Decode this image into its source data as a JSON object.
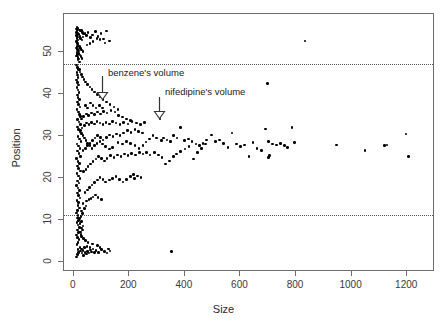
{
  "chart_data": {
    "type": "scatter",
    "title": "",
    "xlabel": "Size",
    "ylabel": "Position",
    "xlim": [
      -35,
      1300
    ],
    "ylim": [
      -2.5,
      59
    ],
    "grid": false,
    "legend": "none",
    "xticks": [
      0,
      200,
      400,
      600,
      800,
      1000,
      1200
    ],
    "yticks": [
      0,
      10,
      20,
      30,
      40,
      50
    ],
    "reference_lines": [
      {
        "name": "upper-dotted-line",
        "axis": "y",
        "value": 47
      },
      {
        "name": "lower-dotted-line",
        "axis": "y",
        "value": 11
      }
    ],
    "annotations": [
      {
        "text": "benzene's volume",
        "x": 105,
        "y": 44.5,
        "arrow_x": 105,
        "arrow_y_from": 44.0,
        "arrow_y_to": 38.5
      },
      {
        "text": "nifedipine's volume",
        "x": 310,
        "y": 40.0,
        "arrow_x": 310,
        "arrow_y_from": 39.0,
        "arrow_y_to": 34.0
      }
    ],
    "points": [
      [
        10,
        55.4
      ],
      [
        12,
        55.1
      ],
      [
        11,
        54.6
      ],
      [
        13,
        54.2
      ],
      [
        10,
        53.9
      ],
      [
        14,
        53.5
      ],
      [
        12,
        53.1
      ],
      [
        15,
        52.8
      ],
      [
        11,
        52.4
      ],
      [
        13,
        52.0
      ],
      [
        16,
        51.6
      ],
      [
        12,
        51.2
      ],
      [
        10,
        50.9
      ],
      [
        14,
        50.5
      ],
      [
        17,
        50.2
      ],
      [
        12,
        49.8
      ],
      [
        13,
        49.4
      ],
      [
        11,
        49.0
      ],
      [
        15,
        48.7
      ],
      [
        18,
        48.3
      ],
      [
        12,
        55.8
      ],
      [
        16,
        55.5
      ],
      [
        20,
        55.2
      ],
      [
        24,
        54.9
      ],
      [
        14,
        54.5
      ],
      [
        19,
        54.1
      ],
      [
        22,
        53.7
      ],
      [
        27,
        55.0
      ],
      [
        31,
        54.6
      ],
      [
        36,
        54.2
      ],
      [
        25,
        53.2
      ],
      [
        30,
        52.8
      ],
      [
        34,
        53.5
      ],
      [
        40,
        54.3
      ],
      [
        45,
        53.9
      ],
      [
        52,
        54.6
      ],
      [
        60,
        53.4
      ],
      [
        68,
        54.0
      ],
      [
        78,
        54.8
      ],
      [
        88,
        53.6
      ],
      [
        98,
        54.4
      ],
      [
        108,
        53.0
      ],
      [
        118,
        54.9
      ],
      [
        128,
        52.6
      ],
      [
        112,
        52.1
      ],
      [
        95,
        52.9
      ],
      [
        84,
        53.2
      ],
      [
        70,
        52.4
      ],
      [
        58,
        52.0
      ],
      [
        48,
        51.6
      ],
      [
        20,
        51.2
      ],
      [
        24,
        50.8
      ],
      [
        28,
        50.4
      ],
      [
        33,
        50.0
      ],
      [
        18,
        49.6
      ],
      [
        22,
        49.2
      ],
      [
        26,
        48.8
      ],
      [
        30,
        48.4
      ],
      [
        16,
        48.0
      ],
      [
        20,
        47.6
      ],
      [
        11,
        46.8
      ],
      [
        13,
        46.2
      ],
      [
        15,
        45.7
      ],
      [
        12,
        45.1
      ],
      [
        14,
        44.5
      ],
      [
        16,
        43.9
      ],
      [
        11,
        43.3
      ],
      [
        13,
        42.7
      ],
      [
        17,
        42.1
      ],
      [
        12,
        41.5
      ],
      [
        15,
        40.9
      ],
      [
        19,
        40.3
      ],
      [
        13,
        39.7
      ],
      [
        16,
        39.1
      ],
      [
        21,
        38.6
      ],
      [
        14,
        38.0
      ],
      [
        18,
        37.4
      ],
      [
        23,
        36.8
      ],
      [
        12,
        36.2
      ],
      [
        17,
        35.6
      ],
      [
        20,
        35.0
      ],
      [
        25,
        34.5
      ],
      [
        14,
        33.9
      ],
      [
        19,
        33.3
      ],
      [
        24,
        32.7
      ],
      [
        13,
        32.1
      ],
      [
        18,
        31.5
      ],
      [
        22,
        31.0
      ],
      [
        28,
        30.4
      ],
      [
        15,
        29.8
      ],
      [
        20,
        29.2
      ],
      [
        26,
        28.6
      ],
      [
        12,
        28.0
      ],
      [
        17,
        27.5
      ],
      [
        23,
        26.9
      ],
      [
        14,
        26.3
      ],
      [
        19,
        25.7
      ],
      [
        25,
        25.1
      ],
      [
        11,
        24.5
      ],
      [
        16,
        23.9
      ],
      [
        21,
        23.3
      ],
      [
        13,
        22.8
      ],
      [
        18,
        22.2
      ],
      [
        24,
        21.6
      ],
      [
        12,
        21.0
      ],
      [
        17,
        20.4
      ],
      [
        22,
        19.8
      ],
      [
        14,
        19.2
      ],
      [
        19,
        18.7
      ],
      [
        11,
        18.1
      ],
      [
        16,
        17.5
      ],
      [
        21,
        16.9
      ],
      [
        13,
        16.3
      ],
      [
        18,
        15.7
      ],
      [
        23,
        15.1
      ],
      [
        12,
        14.6
      ],
      [
        17,
        14.0
      ],
      [
        15,
        13.4
      ],
      [
        20,
        12.8
      ],
      [
        14,
        12.2
      ],
      [
        11,
        11.6
      ],
      [
        16,
        11.0
      ],
      [
        13,
        10.4
      ],
      [
        18,
        9.8
      ],
      [
        12,
        9.3
      ],
      [
        15,
        8.7
      ],
      [
        20,
        8.1
      ],
      [
        14,
        7.5
      ],
      [
        17,
        6.9
      ],
      [
        11,
        6.3
      ],
      [
        13,
        5.7
      ],
      [
        19,
        5.2
      ],
      [
        16,
        4.6
      ],
      [
        12,
        4.0
      ],
      [
        22,
        3.4
      ],
      [
        15,
        2.8
      ],
      [
        18,
        2.2
      ],
      [
        14,
        1.7
      ],
      [
        11,
        1.1
      ],
      [
        25,
        2.5
      ],
      [
        30,
        2.0
      ],
      [
        35,
        1.5
      ],
      [
        28,
        3.0
      ],
      [
        33,
        2.6
      ],
      [
        40,
        2.2
      ],
      [
        45,
        1.8
      ],
      [
        38,
        3.3
      ],
      [
        50,
        2.4
      ],
      [
        55,
        2.0
      ],
      [
        60,
        2.7
      ],
      [
        65,
        2.3
      ],
      [
        70,
        3.0
      ],
      [
        48,
        3.6
      ],
      [
        58,
        3.4
      ],
      [
        75,
        2.1
      ],
      [
        80,
        2.6
      ],
      [
        90,
        2.2
      ],
      [
        100,
        2.8
      ],
      [
        110,
        2.4
      ],
      [
        120,
        2.0
      ],
      [
        130,
        2.5
      ],
      [
        125,
        3.0
      ],
      [
        95,
        3.4
      ],
      [
        85,
        3.8
      ],
      [
        68,
        4.2
      ],
      [
        52,
        4.6
      ],
      [
        42,
        5.0
      ],
      [
        36,
        5.5
      ],
      [
        29,
        6.0
      ],
      [
        26,
        6.5
      ],
      [
        24,
        7.0
      ],
      [
        31,
        7.5
      ],
      [
        27,
        8.0
      ],
      [
        34,
        8.5
      ],
      [
        23,
        9.0
      ],
      [
        29,
        9.5
      ],
      [
        21,
        10.2
      ],
      [
        26,
        10.8
      ],
      [
        32,
        11.4
      ],
      [
        28,
        12.0
      ],
      [
        38,
        12.6
      ],
      [
        44,
        13.2
      ],
      [
        33,
        13.8
      ],
      [
        47,
        14.4
      ],
      [
        55,
        14.8
      ],
      [
        62,
        15.0
      ],
      [
        70,
        15.4
      ],
      [
        78,
        15.9
      ],
      [
        88,
        15.2
      ],
      [
        100,
        14.8
      ],
      [
        41,
        16.5
      ],
      [
        49,
        17.0
      ],
      [
        57,
        17.6
      ],
      [
        66,
        18.2
      ],
      [
        75,
        18.8
      ],
      [
        85,
        19.4
      ],
      [
        95,
        20.0
      ],
      [
        105,
        19.6
      ],
      [
        115,
        19.0
      ],
      [
        128,
        19.4
      ],
      [
        140,
        19.8
      ],
      [
        152,
        20.2
      ],
      [
        165,
        19.5
      ],
      [
        178,
        19.0
      ],
      [
        190,
        19.6
      ],
      [
        205,
        20.2
      ],
      [
        218,
        19.8
      ],
      [
        230,
        20.4
      ],
      [
        242,
        20.0
      ],
      [
        215,
        20.8
      ],
      [
        36,
        21.4
      ],
      [
        44,
        22.0
      ],
      [
        52,
        22.6
      ],
      [
        61,
        23.2
      ],
      [
        70,
        23.8
      ],
      [
        80,
        24.4
      ],
      [
        90,
        25.0
      ],
      [
        100,
        24.6
      ],
      [
        110,
        24.0
      ],
      [
        120,
        24.6
      ],
      [
        132,
        25.2
      ],
      [
        145,
        24.8
      ],
      [
        158,
        25.4
      ],
      [
        170,
        25.0
      ],
      [
        183,
        25.6
      ],
      [
        196,
        25.2
      ],
      [
        208,
        25.8
      ],
      [
        222,
        25.4
      ],
      [
        236,
        26.0
      ],
      [
        250,
        25.6
      ],
      [
        33,
        26.4
      ],
      [
        42,
        27.0
      ],
      [
        50,
        27.6
      ],
      [
        58,
        28.2
      ],
      [
        67,
        28.8
      ],
      [
        76,
        29.4
      ],
      [
        86,
        30.0
      ],
      [
        96,
        29.6
      ],
      [
        106,
        29.0
      ],
      [
        117,
        29.6
      ],
      [
        129,
        30.2
      ],
      [
        141,
        29.8
      ],
      [
        154,
        30.4
      ],
      [
        167,
        30.0
      ],
      [
        180,
        30.6
      ],
      [
        193,
        31.2
      ],
      [
        206,
        30.8
      ],
      [
        220,
        31.4
      ],
      [
        234,
        31.0
      ],
      [
        248,
        30.6
      ],
      [
        30,
        31.8
      ],
      [
        38,
        32.4
      ],
      [
        46,
        33.0
      ],
      [
        55,
        32.6
      ],
      [
        64,
        33.2
      ],
      [
        74,
        32.8
      ],
      [
        84,
        33.4
      ],
      [
        94,
        33.0
      ],
      [
        105,
        32.6
      ],
      [
        116,
        33.2
      ],
      [
        128,
        32.8
      ],
      [
        140,
        33.4
      ],
      [
        152,
        33.0
      ],
      [
        166,
        32.6
      ],
      [
        180,
        33.2
      ],
      [
        195,
        32.8
      ],
      [
        210,
        33.4
      ],
      [
        225,
        33.0
      ],
      [
        240,
        32.6
      ],
      [
        255,
        33.2
      ],
      [
        28,
        34.0
      ],
      [
        36,
        34.6
      ],
      [
        45,
        35.2
      ],
      [
        54,
        34.8
      ],
      [
        64,
        35.4
      ],
      [
        74,
        35.0
      ],
      [
        85,
        35.6
      ],
      [
        96,
        35.2
      ],
      [
        108,
        35.8
      ],
      [
        120,
        35.4
      ],
      [
        134,
        36.0
      ],
      [
        148,
        35.6
      ],
      [
        162,
        34.8
      ],
      [
        176,
        34.4
      ],
      [
        190,
        34.0
      ],
      [
        205,
        33.6
      ],
      [
        160,
        36.2
      ],
      [
        145,
        36.8
      ],
      [
        130,
        37.4
      ],
      [
        118,
        38.0
      ],
      [
        106,
        38.6
      ],
      [
        95,
        39.2
      ],
      [
        85,
        39.8
      ],
      [
        75,
        40.4
      ],
      [
        66,
        41.0
      ],
      [
        58,
        41.6
      ],
      [
        50,
        42.2
      ],
      [
        43,
        42.8
      ],
      [
        37,
        43.4
      ],
      [
        32,
        44.0
      ],
      [
        27,
        44.6
      ],
      [
        23,
        45.2
      ],
      [
        20,
        45.8
      ],
      [
        42,
        37.2
      ],
      [
        50,
        36.6
      ],
      [
        60,
        37.8
      ],
      [
        70,
        37.2
      ],
      [
        80,
        36.6
      ],
      [
        92,
        37.2
      ],
      [
        104,
        36.6
      ],
      [
        260,
        28.5
      ],
      [
        272,
        29.2
      ],
      [
        285,
        30.0
      ],
      [
        298,
        29.4
      ],
      [
        310,
        34.0
      ],
      [
        315,
        28.8
      ],
      [
        322,
        29.4
      ],
      [
        335,
        29.0
      ],
      [
        348,
        28.6
      ],
      [
        352,
        2.4
      ],
      [
        360,
        30.0
      ],
      [
        372,
        29.4
      ],
      [
        385,
        32.0
      ],
      [
        398,
        28.8
      ],
      [
        412,
        29.2
      ],
      [
        425,
        28.6
      ],
      [
        440,
        28.0
      ],
      [
        452,
        27.6
      ],
      [
        465,
        28.2
      ],
      [
        478,
        29.0
      ],
      [
        262,
        26.0
      ],
      [
        275,
        25.4
      ],
      [
        290,
        26.0
      ],
      [
        305,
        25.4
      ],
      [
        318,
        24.8
      ],
      [
        330,
        23.2
      ],
      [
        345,
        24.0
      ],
      [
        358,
        25.0
      ],
      [
        370,
        25.6
      ],
      [
        385,
        26.2
      ],
      [
        400,
        26.8
      ],
      [
        415,
        27.4
      ],
      [
        430,
        24.4
      ],
      [
        445,
        26.0
      ],
      [
        460,
        27.0
      ],
      [
        475,
        28.0
      ],
      [
        495,
        30.2
      ],
      [
        510,
        28.6
      ],
      [
        525,
        29.0
      ],
      [
        540,
        28.2
      ],
      [
        555,
        27.2
      ],
      [
        570,
        30.6
      ],
      [
        585,
        28.0
      ],
      [
        600,
        27.4
      ],
      [
        615,
        27.8
      ],
      [
        630,
        25.0
      ],
      [
        645,
        28.4
      ],
      [
        660,
        27.0
      ],
      [
        675,
        26.4
      ],
      [
        690,
        31.6
      ],
      [
        700,
        28.6
      ],
      [
        705,
        25.2
      ],
      [
        715,
        28.0
      ],
      [
        730,
        27.8
      ],
      [
        745,
        28.2
      ],
      [
        758,
        27.6
      ],
      [
        770,
        27.2
      ],
      [
        785,
        32.0
      ],
      [
        795,
        28.4
      ],
      [
        700,
        24.8
      ],
      [
        945,
        27.8
      ],
      [
        1048,
        26.4
      ],
      [
        1118,
        27.6
      ],
      [
        1128,
        27.8
      ],
      [
        1196,
        30.4
      ],
      [
        1205,
        25.0
      ],
      [
        698,
        42.4
      ],
      [
        832,
        52.6
      ],
      [
        160,
        28.4
      ],
      [
        175,
        28.0
      ],
      [
        190,
        28.6
      ],
      [
        205,
        28.2
      ],
      [
        220,
        27.6
      ],
      [
        235,
        27.0
      ],
      [
        250,
        27.6
      ],
      [
        140,
        27.2
      ],
      [
        128,
        26.8
      ],
      [
        115,
        27.4
      ],
      [
        104,
        28.0
      ],
      [
        94,
        28.6
      ],
      [
        84,
        28.2
      ],
      [
        74,
        27.6
      ],
      [
        66,
        27.0
      ],
      [
        58,
        27.6
      ],
      [
        50,
        28.2
      ],
      [
        44,
        28.8
      ],
      [
        38,
        29.4
      ],
      [
        33,
        30.0
      ],
      [
        29,
        30.6
      ],
      [
        25,
        31.2
      ]
    ]
  }
}
